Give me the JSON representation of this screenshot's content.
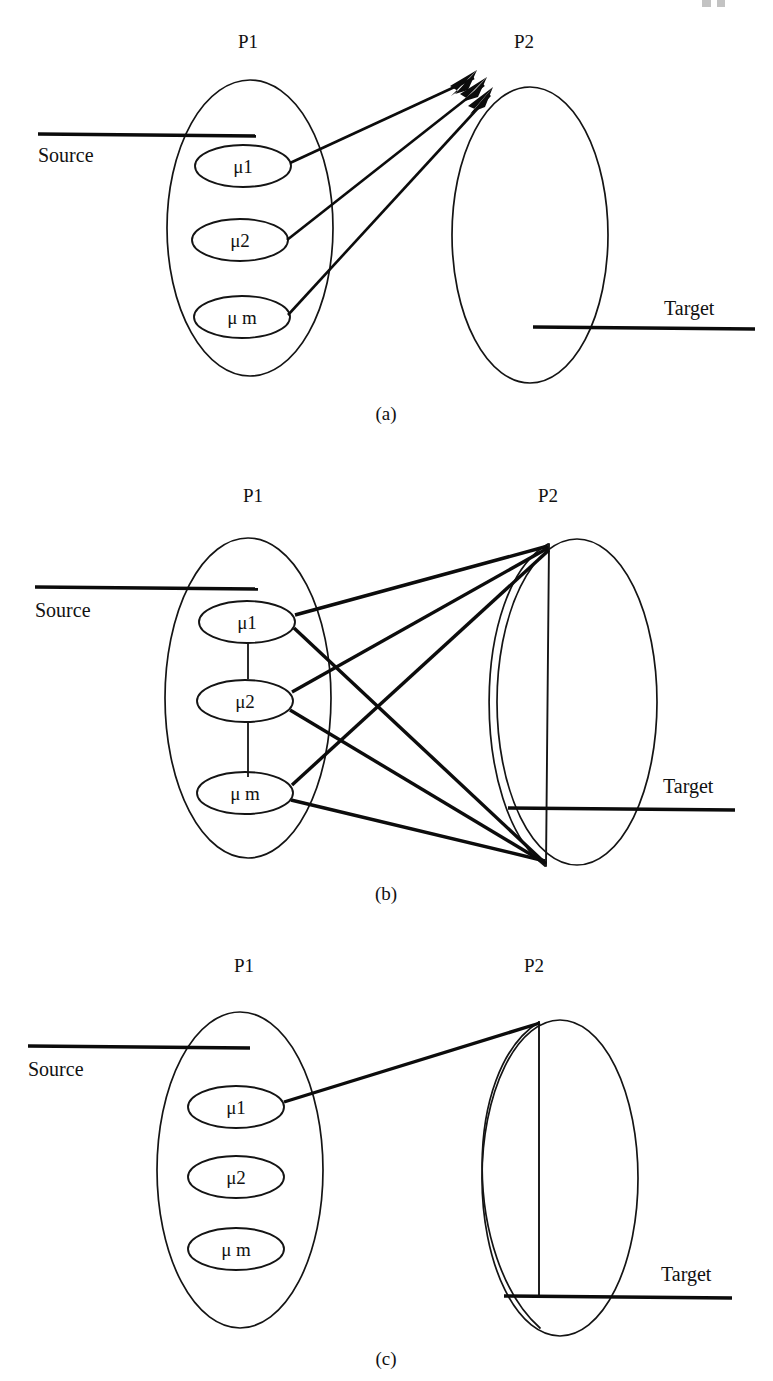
{
  "figure": {
    "background_color": "#ffffff",
    "ink_color": "#111111",
    "panel_count": 3
  },
  "panels": [
    {
      "id": "panel-a",
      "caption": "(a)",
      "set_left_label": "P1",
      "set_right_label": "P2",
      "source_label": "Source",
      "target_label": "Target",
      "nodes": [
        {
          "id": "mu1",
          "label": "μ1"
        },
        {
          "id": "mu2",
          "label": "μ2"
        },
        {
          "id": "mum",
          "label": "μ m"
        }
      ],
      "edges": [
        {
          "from": "mu1",
          "to": "P2-upper-left",
          "arrow": true
        },
        {
          "from": "mu2",
          "to": "P2-upper-left",
          "arrow": true
        },
        {
          "from": "mum",
          "to": "P2-upper-left",
          "arrow": true
        }
      ],
      "chain_links": [],
      "p2_chord": false
    },
    {
      "id": "panel-b",
      "caption": "(b)",
      "set_left_label": "P1",
      "set_right_label": "P2",
      "source_label": "Source",
      "target_label": "Target",
      "nodes": [
        {
          "id": "mu1",
          "label": "μ1"
        },
        {
          "id": "mu2",
          "label": "μ2"
        },
        {
          "id": "mum",
          "label": "μ m"
        }
      ],
      "edges": [
        {
          "from": "mu1",
          "to": "P2-top",
          "arrow": false
        },
        {
          "from": "mu1",
          "to": "P2-bottom",
          "arrow": false
        },
        {
          "from": "mu2",
          "to": "P2-top",
          "arrow": false
        },
        {
          "from": "mu2",
          "to": "P2-bottom",
          "arrow": false
        },
        {
          "from": "mum",
          "to": "P2-top",
          "arrow": false
        },
        {
          "from": "mum",
          "to": "P2-bottom",
          "arrow": false
        }
      ],
      "chain_links": [
        {
          "from": "mu1",
          "to": "mu2"
        },
        {
          "from": "mu2",
          "to": "mum"
        }
      ],
      "p2_chord": true
    },
    {
      "id": "panel-c",
      "caption": "(c)",
      "set_left_label": "P1",
      "set_right_label": "P2",
      "source_label": "Source",
      "target_label": "Target",
      "nodes": [
        {
          "id": "mu1",
          "label": "μ1"
        },
        {
          "id": "mu2",
          "label": "μ2"
        },
        {
          "id": "mum",
          "label": "μ m"
        }
      ],
      "edges": [
        {
          "from": "mu1",
          "to": "P2-top",
          "arrow": false
        }
      ],
      "chain_links": [],
      "p2_chord": true
    }
  ]
}
